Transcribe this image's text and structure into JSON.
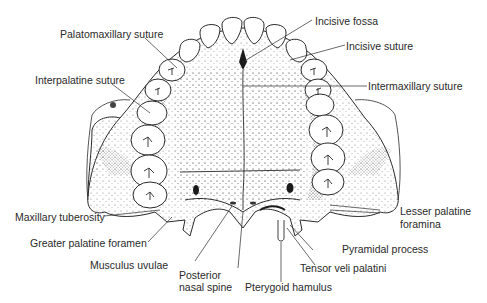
{
  "figure": {
    "labels": {
      "incisive_fossa": "Incisive fossa",
      "palatomaxillary_suture": "Palatomaxillary suture",
      "incisive_suture": "Incisive suture",
      "interpalatine_suture": "Interpalatine suture",
      "intermaxillary_suture": "Intermaxillary suture",
      "maxillary_tuberosity": "Maxillary tuberosity",
      "lesser_palatine_foramina_1": "Lesser palatine",
      "lesser_palatine_foramina_2": "foramina",
      "greater_palatine_foramen": "Greater palatine foramen",
      "pyramidal_process": "Pyramidal process",
      "musculus_uvulae": "Musculus uvulae",
      "posterior_nasal_spine_1": "Posterior",
      "posterior_nasal_spine_2": "nasal spine",
      "tensor_veli_palatini": "Tensor veli palatini",
      "pterygoid_hamulus": "Pterygoid hamulus"
    },
    "colors": {
      "ink": "#2a2a2a",
      "background": "#ffffff",
      "stipple": "#555555"
    }
  }
}
